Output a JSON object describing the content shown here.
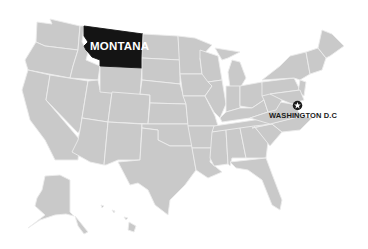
{
  "map": {
    "title": "United States",
    "highlighted_state": {
      "name": "Montana",
      "label": "MONTANA",
      "color": "#141414"
    },
    "capital_marker": {
      "label": "WASHINGTON D.C",
      "icon": "star-circle-icon"
    },
    "colors": {
      "state_fill": "#c9c9c9",
      "border": "#ececec",
      "background": "#ffffff"
    },
    "insets": [
      "Alaska",
      "Hawaii"
    ]
  }
}
